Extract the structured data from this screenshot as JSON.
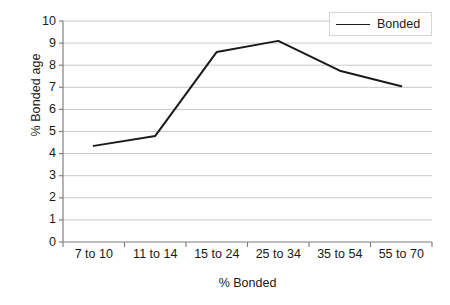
{
  "chart_data": {
    "type": "line",
    "title": "",
    "xlabel": "% Bonded",
    "ylabel": "% Bonded age",
    "categories": [
      "7 to 10",
      "11 to 14",
      "15 to 24",
      "25 to 34",
      "35 to 54",
      "55 to 70"
    ],
    "series": [
      {
        "name": "Bonded",
        "values": [
          4.35,
          4.8,
          8.6,
          9.1,
          7.75,
          7.05
        ],
        "color": "#1a1a1a"
      }
    ],
    "ylim": [
      0,
      10
    ],
    "ytick_labels": [
      "0",
      "1",
      "2",
      "3",
      "4",
      "5",
      "6",
      "7",
      "8",
      "9",
      "10"
    ],
    "ytick_values": [
      0,
      1,
      2,
      3,
      4,
      5,
      6,
      7,
      8,
      9,
      10
    ],
    "grid": true,
    "grid_axis": "y",
    "grid_color": "#c9c9c9",
    "axis_color": "#808080",
    "legend_position": "top-right",
    "legend_entries": [
      "Bonded"
    ],
    "background": "#ffffff"
  },
  "legend": {
    "label": "Bonded"
  }
}
